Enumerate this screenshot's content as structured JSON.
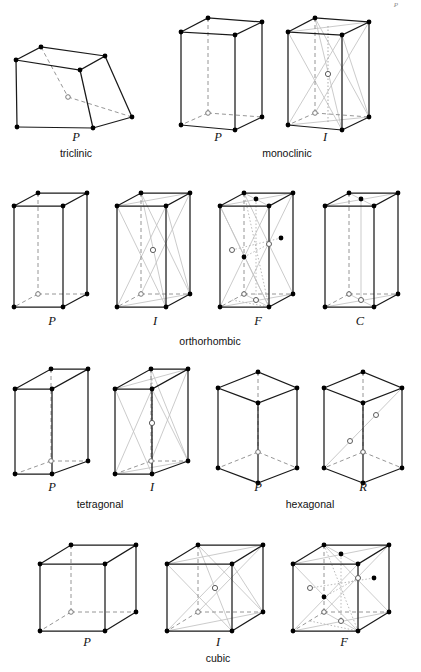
{
  "figure": {
    "corner_mark": "P",
    "background_color": "#ffffff",
    "stroke_solid_color": "#1a1a1a",
    "stroke_hidden_color": "#8a8a8a",
    "stroke_centering_color": "#bdbdbd",
    "node_filled_color": "#000000",
    "node_open_color": "#ffffff"
  },
  "rows": [
    {
      "name": "row-1",
      "systems": [
        {
          "label": "triclinic",
          "label_x": 76,
          "label_y": 157
        },
        {
          "label": "monoclinic",
          "label_x": 287,
          "label_y": 157
        }
      ],
      "cells": [
        {
          "name": "triclinic-P",
          "label": "P",
          "label_x": 76,
          "label_y": 141
        },
        {
          "name": "monoclinic-P",
          "label": "P",
          "label_x": 218,
          "label_y": 141
        },
        {
          "name": "monoclinic-I",
          "label": "I",
          "label_x": 325,
          "label_y": 141
        }
      ]
    },
    {
      "name": "row-2",
      "systems": [
        {
          "label": "orthorhombic",
          "label_x": 210,
          "label_y": 345
        }
      ],
      "cells": [
        {
          "name": "orthorhombic-P",
          "label": "P",
          "label_x": 52,
          "label_y": 325
        },
        {
          "name": "orthorhombic-I",
          "label": "I",
          "label_x": 155,
          "label_y": 325
        },
        {
          "name": "orthorhombic-F",
          "label": "F",
          "label_x": 258,
          "label_y": 325
        },
        {
          "name": "orthorhombic-C",
          "label": "C",
          "label_x": 360,
          "label_y": 325
        }
      ]
    },
    {
      "name": "row-3",
      "systems": [
        {
          "label": "tetragonal",
          "label_x": 100,
          "label_y": 508
        },
        {
          "label": "hexagonal",
          "label_x": 310,
          "label_y": 508
        }
      ],
      "cells": [
        {
          "name": "tetragonal-P",
          "label": "P",
          "label_x": 52,
          "label_y": 491
        },
        {
          "name": "tetragonal-I",
          "label": "I",
          "label_x": 152,
          "label_y": 491
        },
        {
          "name": "hexagonal-P",
          "label": "P",
          "label_x": 258,
          "label_y": 491
        },
        {
          "name": "hexagonal-R",
          "label": "R",
          "label_x": 363,
          "label_y": 491
        }
      ]
    },
    {
      "name": "row-4",
      "systems": [
        {
          "label": "cubic",
          "label_x": 218,
          "label_y": 662
        }
      ],
      "cells": [
        {
          "name": "cubic-P",
          "label": "P",
          "label_x": 87,
          "label_y": 646
        },
        {
          "name": "cubic-I",
          "label": "I",
          "label_x": 218,
          "label_y": 646
        },
        {
          "name": "cubic-F",
          "label": "F",
          "label_x": 344,
          "label_y": 646
        }
      ]
    }
  ]
}
